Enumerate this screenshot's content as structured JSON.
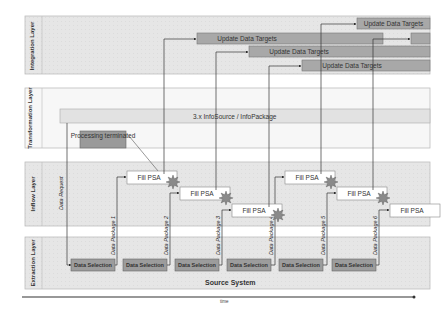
{
  "layers": [
    {
      "id": "integration",
      "label": "Integration Layer"
    },
    {
      "id": "transformation",
      "label": "Transformation Layer"
    },
    {
      "id": "inflow",
      "label": "Inflow Layer"
    },
    {
      "id": "extraction",
      "label": "Extraction Layer"
    }
  ],
  "infosource_label": "3.x InfoSource / InfoPackage",
  "processing_terminated_label": "Processing terminated",
  "data_request_label": "Data Request",
  "update_targets": [
    "Update Data Targets",
    "Update Data Targets",
    "Update Data Targets",
    "Update Data Targets",
    "Update Data Targets"
  ],
  "fill_psa": [
    "Fill PSA",
    "Fill PSA",
    "Fill PSA",
    "Fill PSA",
    "Fill PSA",
    "Fill PSA"
  ],
  "data_packages": [
    "Data Package 1",
    "Data Package 2",
    "Data Package 3",
    "Data Package 4",
    "Data Package 5",
    "Data Package 6"
  ],
  "data_selections": [
    "Data Selection",
    "Data Selection",
    "Data Selection",
    "Data Selection",
    "Data Selection",
    "Data Selection"
  ],
  "source_system_label": "Source System",
  "time_axis_label": "time"
}
